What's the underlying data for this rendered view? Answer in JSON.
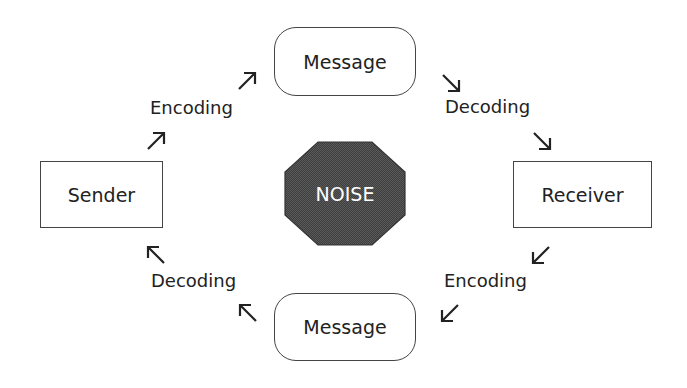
{
  "diagram": {
    "nodes": {
      "sender": "Sender",
      "receiver": "Receiver",
      "message_top": "Message",
      "message_bottom": "Message",
      "noise": "NOISE"
    },
    "edge_labels": {
      "top_left": "Encoding",
      "top_right": "Decoding",
      "bottom_right": "Encoding",
      "bottom_left": "Decoding"
    },
    "colors": {
      "stroke": "#444444",
      "text": "#222222",
      "noise_fill": "#555555",
      "noise_text": "#ffffff"
    },
    "arrows": [
      {
        "id": "a1",
        "direction": "up-right"
      },
      {
        "id": "a2",
        "direction": "up-right"
      },
      {
        "id": "a3",
        "direction": "down-right"
      },
      {
        "id": "a4",
        "direction": "down-right"
      },
      {
        "id": "a5",
        "direction": "down-left"
      },
      {
        "id": "a6",
        "direction": "down-left"
      },
      {
        "id": "a7",
        "direction": "up-left"
      },
      {
        "id": "a8",
        "direction": "up-left"
      }
    ]
  }
}
